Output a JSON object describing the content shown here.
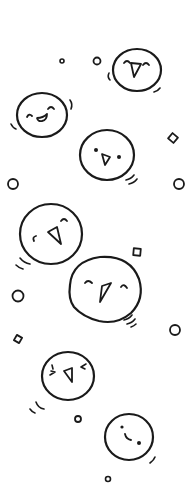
{
  "illustration": {
    "description": "Hand-drawn doodle of seven bouncing round smiley faces with confetti circles and diamonds",
    "background": "#ffffff",
    "ink_color": "#1a1a1a",
    "faces": [
      {
        "id": "face-1",
        "expression": "happy-closed-eyes-open-beak",
        "cx": 137,
        "cy": 70,
        "r": 23
      },
      {
        "id": "face-2",
        "expression": "laughing-closed-eyes-grin",
        "cx": 42,
        "cy": 114,
        "r": 24
      },
      {
        "id": "face-3",
        "expression": "dot-eyes-open-mouth",
        "cx": 107,
        "cy": 155,
        "r": 27
      },
      {
        "id": "face-4",
        "expression": "happy-closed-eyes-open-beak",
        "cx": 51,
        "cy": 234,
        "r": 32
      },
      {
        "id": "face-5",
        "expression": "happy-closed-eyes-open-beak",
        "cx": 104,
        "cy": 290,
        "r": 36
      },
      {
        "id": "face-6",
        "expression": "squinting-eyes-open-beak",
        "cx": 68,
        "cy": 375,
        "r": 26
      },
      {
        "id": "face-7",
        "expression": "dot-eyes-smile",
        "cx": 129,
        "cy": 436,
        "r": 24
      }
    ],
    "confetti_circles": [
      {
        "cx": 62,
        "cy": 61,
        "r": 2
      },
      {
        "cx": 97,
        "cy": 61,
        "r": 3.5
      },
      {
        "cx": 13,
        "cy": 184,
        "r": 5
      },
      {
        "cx": 179,
        "cy": 184,
        "r": 5
      },
      {
        "cx": 18,
        "cy": 296,
        "r": 5
      },
      {
        "cx": 175,
        "cy": 330,
        "r": 5
      },
      {
        "cx": 78,
        "cy": 419,
        "r": 3
      },
      {
        "cx": 108,
        "cy": 479,
        "r": 2.5
      }
    ],
    "confetti_diamonds": [
      {
        "cx": 173,
        "cy": 138,
        "size": 7,
        "rotate": 40
      },
      {
        "cx": 137,
        "cy": 252,
        "size": 7,
        "rotate": 5
      },
      {
        "cx": 18,
        "cy": 339,
        "size": 6,
        "rotate": 30
      }
    ]
  }
}
